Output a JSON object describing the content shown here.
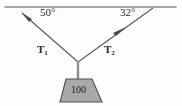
{
  "figure": {
    "background_color": "#fdfdfd",
    "stroke_color": "#4a4a4a",
    "ceiling": {
      "label": "ceiling",
      "x1": 5,
      "y1": 7,
      "x2": 176,
      "y2": 7
    },
    "junction": {
      "x": 78,
      "y": 62
    },
    "ropes": [
      {
        "name": "rope-left",
        "tension_label": "T",
        "tension_subscript": "1",
        "angle_label": "50°",
        "angle_degrees": 50,
        "anchor": {
          "x": 22,
          "y": 14
        },
        "arrow_at": {
          "x": 26,
          "y": 18
        }
      },
      {
        "name": "rope-right",
        "tension_label": "T",
        "tension_subscript": "2",
        "angle_label": "32°",
        "angle_degrees": 32,
        "anchor": {
          "x": 152,
          "y": 9
        },
        "arrow_at": {
          "x": 119,
          "y": 31
        }
      }
    ],
    "hanging_rope": {
      "x": 78,
      "y1": 62,
      "y2": 79
    },
    "weight": {
      "label": "100",
      "shape": "trapezoid",
      "fill_color": "#a9a9a9",
      "edge_color": "#4a4a4a",
      "top_left_x": 66,
      "top_right_x": 92,
      "bottom_left_x": 60,
      "bottom_right_x": 102,
      "top_y": 79,
      "bottom_y": 102
    }
  }
}
